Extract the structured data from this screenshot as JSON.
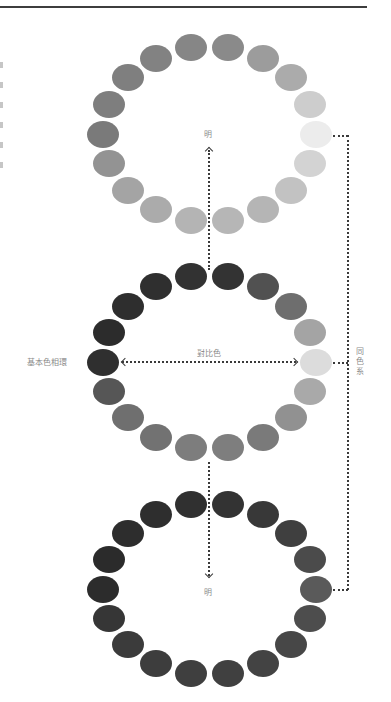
{
  "diagram": {
    "top_ring": {
      "name": "light-ring",
      "center": [
        209.5,
        134
      ],
      "radius": [
        106.5,
        87.5
      ],
      "colors": [
        "#8a8a8a",
        "#9c9c9c",
        "#ababab",
        "#cdcdcd",
        "#ececec",
        "#d3d3d3",
        "#c2c2c2",
        "#b5b5b5",
        "#b6b6b6",
        "#b4b4b4",
        "#ababab",
        "#a4a4a4",
        "#939393",
        "#7a7a7a",
        "#7e7e7e",
        "#7f7f7f",
        "#828282",
        "#868686"
      ]
    },
    "middle_ring": {
      "name": "basic-hue-ring",
      "center": [
        209.5,
        362
      ],
      "radius": [
        106.5,
        87
      ],
      "colors": [
        "#333333",
        "#515151",
        "#6e6e6e",
        "#a4a4a4",
        "#dcdcdc",
        "#a9a9a9",
        "#919191",
        "#7a7a7a",
        "#7e7e7e",
        "#7d7d7d",
        "#727272",
        "#6f6f6f",
        "#565656",
        "#2f2f2f",
        "#2c2c2c",
        "#2e2e2e",
        "#2f2f2f",
        "#323232"
      ]
    },
    "bottom_ring": {
      "name": "dark-ring",
      "center": [
        209.5,
        589
      ],
      "radius": [
        106.5,
        86
      ],
      "colors": [
        "#333333",
        "#383838",
        "#3f3f3f",
        "#4b4b4b",
        "#5a5a5a",
        "#4d4d4d",
        "#474747",
        "#434343",
        "#404040",
        "#3f3f3f",
        "#3d3d3d",
        "#3b3b3b",
        "#363636",
        "#2c2c2c",
        "#2b2b2b",
        "#2d2d2d",
        "#2e2e2e",
        "#303030"
      ]
    },
    "labels": {
      "top_light": "明",
      "bottom_light": "明",
      "contrast": "對比色",
      "basic_hue_ring": "基本色相環",
      "same_color_family": "同色系"
    }
  }
}
